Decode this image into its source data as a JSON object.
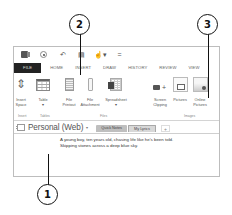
{
  "quick_access": {
    "items": [
      {
        "name": "onenote-logo"
      },
      {
        "name": "back"
      },
      {
        "name": "undo",
        "glyph": "↶"
      },
      {
        "name": "dock",
        "glyph": "▤"
      },
      {
        "name": "touch-mode",
        "glyph": "☝▾"
      },
      {
        "name": "customize",
        "glyph": "="
      }
    ]
  },
  "tabs": [
    "FILE",
    "HOME",
    "INSERT",
    "DRAW",
    "HISTORY",
    "REVIEW",
    "VIEW"
  ],
  "ribbon": {
    "buttons": [
      {
        "id": "insert-space",
        "label": "Insert\nSpace"
      },
      {
        "id": "table",
        "label": "Table\n▾"
      },
      {
        "id": "file-printout",
        "label": "File\nPrintout"
      },
      {
        "id": "file-attachment",
        "label": "File\nAttachment"
      },
      {
        "id": "spreadsheet",
        "label": "Spreadsheet\n▾"
      },
      {
        "id": "screen-clipping",
        "label": "Screen\nClipping"
      },
      {
        "id": "pictures",
        "label": "Pictures"
      },
      {
        "id": "online-pictures",
        "label": "Online\nPictures"
      }
    ],
    "groups": [
      "Insert",
      "Tables",
      "Files",
      "Images"
    ]
  },
  "notebook": {
    "name": "Personal (Web)",
    "caret": "▾",
    "sections": [
      "Quick Notes",
      "My Lyrics"
    ],
    "add_section": "+"
  },
  "note": {
    "lines": [
      "A young boy, ten years old, chasing life like he's been told.",
      "Skipping stones across a deep blue sky."
    ]
  },
  "callouts": [
    "1",
    "2",
    "3"
  ]
}
